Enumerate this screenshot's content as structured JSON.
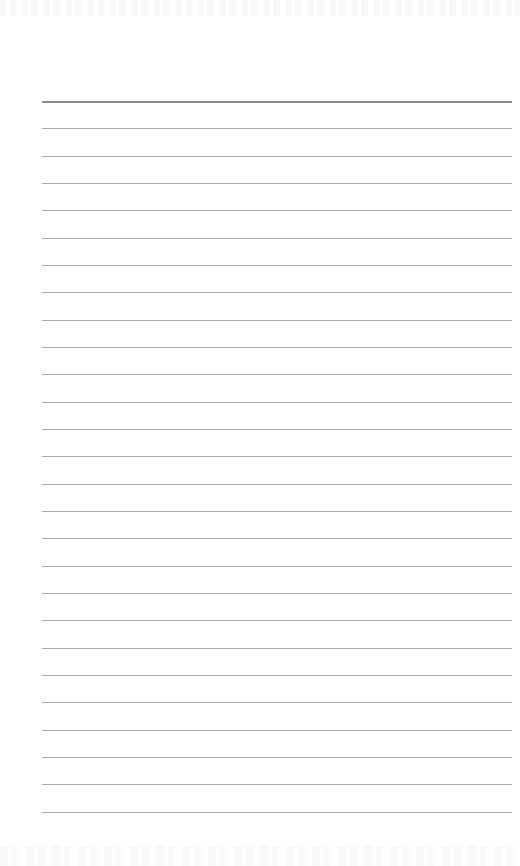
{
  "page": {
    "type": "ruled-notebook-page",
    "background_color": "#ffffff",
    "rule_color": "#a9a9a9",
    "header_rule_color": "#8a8a8a",
    "line_count": 27,
    "first_line_y": 101,
    "line_spacing_px": 27.33,
    "line_left_x": 42,
    "line_right_x": 512,
    "text_content": []
  }
}
